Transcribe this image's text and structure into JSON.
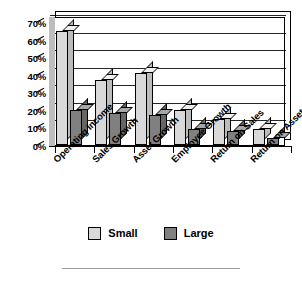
{
  "chart_data": {
    "type": "bar",
    "title": "",
    "xlabel": "",
    "ylabel": "",
    "ylim": [
      0,
      70
    ],
    "ytick_labels": [
      "70%",
      "60%",
      "50%",
      "40%",
      "30%",
      "20%",
      "10%",
      "0%"
    ],
    "ytick_values": [
      70,
      60,
      50,
      40,
      30,
      20,
      10,
      0
    ],
    "grid": true,
    "legend_position": "bottom",
    "style": "3d-grouped-column",
    "categories": [
      "Operating Income",
      "Sales Growth",
      "Asset Growth",
      "Employee Growth",
      "Return on Sales",
      "Return on Assets"
    ],
    "series": [
      {
        "name": "Small",
        "color": "#D9D9D9",
        "values": [
          65,
          37,
          41,
          20,
          15,
          9
        ]
      },
      {
        "name": "Large",
        "color": "#808080",
        "values": [
          20,
          18,
          17,
          9,
          8,
          4
        ]
      }
    ]
  },
  "legend": {
    "items": [
      {
        "label": "Small",
        "color": "#D9D9D9"
      },
      {
        "label": "Large",
        "color": "#808080"
      }
    ]
  },
  "colors": {
    "small_fill": "#D9D9D9",
    "large_fill": "#808080",
    "outline": "#000000",
    "rule": "#9A9A9A",
    "background": "#FFFFFF"
  }
}
